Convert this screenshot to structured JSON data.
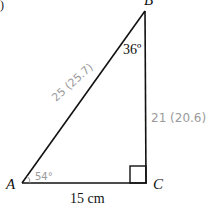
{
  "figure": {
    "part_marker": ")",
    "vertices": {
      "A": "A",
      "B": "B",
      "C": "C"
    },
    "angles": {
      "at_B": "36º",
      "at_A_handwritten": "54°"
    },
    "sides": {
      "AC": "15 cm",
      "AB_handwritten": "25 (25.7)",
      "BC_handwritten": "21 (20.6)"
    },
    "right_angle_at": "C",
    "colors": {
      "line": "#111111",
      "handwriting": "#9a9a9a"
    }
  }
}
